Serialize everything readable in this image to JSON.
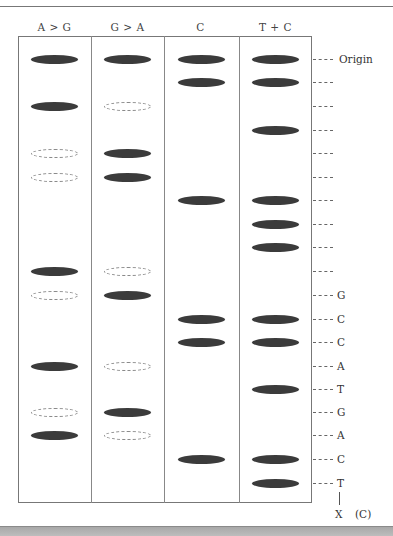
{
  "lanes": [
    {
      "name": "A > G",
      "left": 18
    },
    {
      "name": "G > A",
      "left": 91
    },
    {
      "name": "C",
      "left": 164
    },
    {
      "name": "T + C",
      "left": 239
    }
  ],
  "row_y": [
    59,
    82,
    106,
    130,
    153,
    177,
    200,
    224,
    247,
    271,
    295,
    319,
    342,
    366,
    389,
    412,
    435,
    459,
    483
  ],
  "bands": [
    [
      "solid",
      "solid",
      "solid",
      "solid"
    ],
    [
      "",
      "",
      "solid",
      "solid"
    ],
    [
      "solid",
      "dashed",
      "",
      ""
    ],
    [
      "",
      "",
      "",
      "solid"
    ],
    [
      "dashed",
      "solid",
      "",
      ""
    ],
    [
      "dashed",
      "solid",
      "",
      ""
    ],
    [
      "",
      "",
      "solid",
      "solid"
    ],
    [
      "",
      "",
      "",
      "solid"
    ],
    [
      "",
      "",
      "",
      "solid"
    ],
    [
      "solid",
      "dashed",
      "",
      ""
    ],
    [
      "dashed",
      "solid",
      "",
      ""
    ],
    [
      "",
      "",
      "solid",
      "solid"
    ],
    [
      "",
      "",
      "solid",
      "solid"
    ],
    [
      "solid",
      "dashed",
      "",
      ""
    ],
    [
      "",
      "",
      "",
      "solid"
    ],
    [
      "dashed",
      "solid",
      "",
      ""
    ],
    [
      "solid",
      "dashed",
      "",
      ""
    ],
    [
      "",
      "",
      "solid",
      "solid"
    ],
    [
      "",
      "",
      "",
      "solid"
    ]
  ],
  "row_labels": [
    "Origin",
    "",
    "",
    "",
    "",
    "",
    "",
    "",
    "",
    "",
    "G",
    "C",
    "C",
    "A",
    "T",
    "G",
    "A",
    "C",
    "T"
  ],
  "sequence_end_label": "X",
  "figure_label": "(C)",
  "colors": {
    "solid_band": "#3b3b3b",
    "dashed_band": "#8a8a8a",
    "border": "#777777"
  }
}
